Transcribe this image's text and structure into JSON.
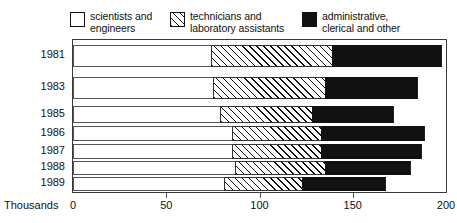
{
  "legend": {
    "items": [
      {
        "label": "scientists and\nengineers",
        "swatch": "white-swatch-icon",
        "fill": "#ffffff"
      },
      {
        "label": "technicians and\nlaboratory assistants",
        "swatch": "hatched-swatch-icon",
        "fill": "#ffffff"
      },
      {
        "label": "administrative,\nclerical and other",
        "swatch": "black-swatch-icon",
        "fill": "#111111"
      }
    ]
  },
  "axis": {
    "units_label": "Thousands",
    "x_ticks": [
      "0",
      "50",
      "100",
      "150",
      "200"
    ],
    "y_ticks": [
      "1981",
      "1983",
      "1985",
      "1986",
      "1987",
      "1988",
      "1989"
    ]
  },
  "chart_data": {
    "type": "bar",
    "orientation": "horizontal",
    "stacked": true,
    "title": "",
    "xlabel": "Thousands",
    "ylabel": "",
    "xlim": [
      0,
      200
    ],
    "grid": false,
    "categories": [
      "1981",
      "1983",
      "1985",
      "1986",
      "1987",
      "1988",
      "1989"
    ],
    "series": [
      {
        "name": "scientists and engineers",
        "fill": "#ffffff",
        "pattern": "solid",
        "values": [
          74,
          75,
          79,
          85,
          85,
          87,
          81
        ]
      },
      {
        "name": "technicians and laboratory assistants",
        "fill": "#ffffff",
        "pattern": "diagonal-hatch",
        "values": [
          65,
          60,
          49,
          48,
          48,
          48,
          42
        ]
      },
      {
        "name": "administrative, clerical and other",
        "fill": "#111111",
        "pattern": "solid",
        "values": [
          59,
          50,
          44,
          56,
          54,
          46,
          45
        ]
      }
    ],
    "cumulative": [
      {
        "category": "1981",
        "stops": [
          74,
          139,
          198
        ]
      },
      {
        "category": "1983",
        "stops": [
          75,
          135,
          185
        ]
      },
      {
        "category": "1985",
        "stops": [
          79,
          128,
          172
        ]
      },
      {
        "category": "1986",
        "stops": [
          85,
          133,
          189
        ]
      },
      {
        "category": "1987",
        "stops": [
          85,
          133,
          187
        ]
      },
      {
        "category": "1988",
        "stops": [
          87,
          135,
          181
        ]
      },
      {
        "category": "1989",
        "stops": [
          81,
          123,
          168
        ]
      }
    ],
    "totals": [
      198,
      185,
      172,
      189,
      187,
      181,
      168
    ]
  }
}
